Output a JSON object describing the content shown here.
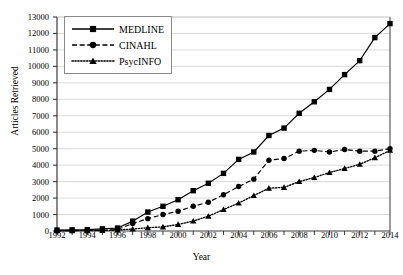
{
  "chart_data": {
    "type": "line",
    "title": "",
    "xlabel": "Year",
    "ylabel": "Articles Retrieved",
    "xlim": [
      1992,
      2014
    ],
    "ylim": [
      0,
      13000
    ],
    "grid": true,
    "legend_position": "top-left",
    "x": [
      1992,
      1993,
      1994,
      1995,
      1996,
      1997,
      1998,
      1999,
      2000,
      2001,
      2002,
      2003,
      2004,
      2005,
      2006,
      2007,
      2008,
      2009,
      2010,
      2011,
      2012,
      2013,
      2014
    ],
    "xticks": [
      "1992",
      "1994",
      "1996",
      "1998",
      "2000",
      "2002",
      "2004",
      "2006",
      "2008",
      "2010",
      "2012",
      "2014"
    ],
    "yticks": [
      "0",
      "1000",
      "2000",
      "3000",
      "4000",
      "5000",
      "6000",
      "7000",
      "8000",
      "9000",
      "10000",
      "11000",
      "12000",
      "13000"
    ],
    "series": [
      {
        "name": "MEDLINE",
        "marker": "square",
        "line_style": "solid",
        "color": "#000000",
        "values": [
          60,
          70,
          80,
          130,
          180,
          600,
          1150,
          1500,
          1900,
          2450,
          2900,
          3500,
          4350,
          4800,
          5800,
          6250,
          7150,
          7850,
          8600,
          9500,
          10350,
          11750,
          12600
        ]
      },
      {
        "name": "CINAHL",
        "marker": "circle",
        "line_style": "dashed",
        "color": "#000000",
        "values": [
          20,
          25,
          30,
          40,
          100,
          450,
          750,
          1000,
          1200,
          1500,
          1750,
          2200,
          2700,
          3150,
          4300,
          4400,
          4850,
          4900,
          4800,
          4950,
          4850,
          4850,
          5000
        ]
      },
      {
        "name": "PsycINFO",
        "marker": "triangle",
        "line_style": "dotted",
        "color": "#000000",
        "values": [
          15,
          18,
          20,
          25,
          60,
          120,
          200,
          250,
          400,
          600,
          900,
          1300,
          1700,
          2150,
          2600,
          2650,
          3000,
          3250,
          3550,
          3800,
          4050,
          4450,
          4900
        ]
      }
    ]
  },
  "axis": {
    "y_title": "Articles Retrieved",
    "x_title": "Year"
  },
  "legend": {
    "items": [
      {
        "label": "MEDLINE"
      },
      {
        "label": "CINAHL"
      },
      {
        "label": "PsycINFO"
      }
    ]
  },
  "colors": {
    "ink": "#000000",
    "grid": "#c9c9c9",
    "axis": "#3a3a3a",
    "legend_border": "#8a8a8a",
    "background": "#ffffff"
  }
}
